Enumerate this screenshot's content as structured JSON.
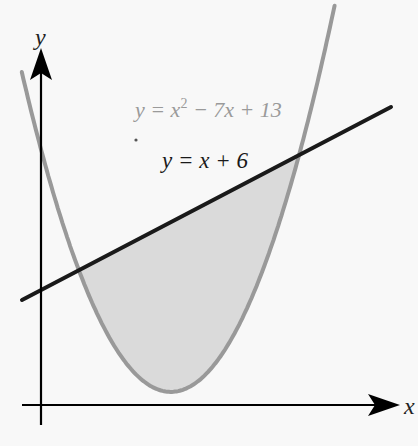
{
  "diagram": {
    "title": "",
    "axes": {
      "x_label": "x",
      "y_label": "y"
    },
    "curves": [
      {
        "name": "parabola",
        "equation_label": {
          "lhs": "y = x",
          "sup": "2",
          "rhs": " − 7x + 13"
        },
        "color": "#9a9a9a"
      },
      {
        "name": "line",
        "equation_label": "y = x + 6",
        "color": "#1a1a1a"
      }
    ],
    "shaded_region": {
      "description": "Region between the line y = x + 6 and the parabola y = x² − 7x + 13",
      "fill": "#d9d9d9",
      "x_range": [
        1,
        7
      ]
    },
    "intersections": [
      {
        "x": 1,
        "y": 7
      },
      {
        "x": 7,
        "y": 13
      }
    ]
  }
}
